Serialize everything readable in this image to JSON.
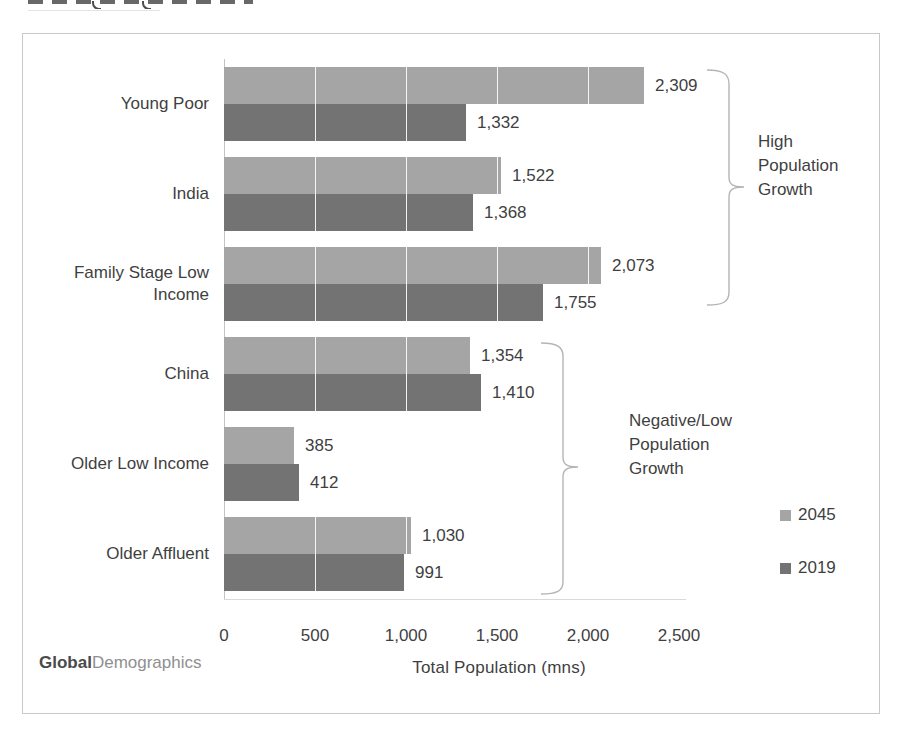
{
  "chart_data": {
    "type": "bar",
    "orientation": "horizontal",
    "title": "",
    "xlabel": "Total Population (mns)",
    "ylabel": "",
    "xlim": [
      0,
      2500
    ],
    "xticks": [
      "0",
      "500",
      "1,000",
      "1,500",
      "2,000",
      "2,500"
    ],
    "grid": "white vertical gridlines at ticks",
    "legend_position": "right",
    "categories": [
      "Young Poor",
      "India",
      "Family Stage Low Income",
      "China",
      "Older Low Income",
      "Older Affluent"
    ],
    "series": [
      {
        "name": "2045",
        "color": "#a5a5a5",
        "values": [
          2309,
          1522,
          2073,
          1354,
          385,
          1030
        ],
        "labels": [
          "2,309",
          "1,522",
          "2,073",
          "1,354",
          "385",
          "1,030"
        ]
      },
      {
        "name": "2019",
        "color": "#737373",
        "values": [
          1332,
          1368,
          1755,
          1410,
          412,
          991
        ],
        "labels": [
          "1,332",
          "1,368",
          "1,755",
          "1,410",
          "412",
          "991"
        ]
      }
    ]
  },
  "axis": {
    "title": "Total Population (mns)"
  },
  "annotations": {
    "high": {
      "text": "High Population Growth",
      "applies_to": [
        "Young Poor",
        "India",
        "Family Stage Low Income"
      ]
    },
    "low": {
      "text": "Negative/Low Population Growth",
      "applies_to": [
        "China",
        "Older Low Income",
        "Older Affluent"
      ]
    }
  },
  "legend": {
    "items": [
      {
        "label": "2045",
        "color": "#a5a5a5"
      },
      {
        "label": "2019",
        "color": "#737373"
      }
    ]
  },
  "logo": {
    "bold": "Global",
    "light": "Demographics"
  },
  "colors": {
    "series_2045": "#a5a5a5",
    "series_2019": "#737373",
    "text": "#3f3f3f",
    "box_border": "#c9c9c9",
    "bracket": "#b5b5b5"
  }
}
